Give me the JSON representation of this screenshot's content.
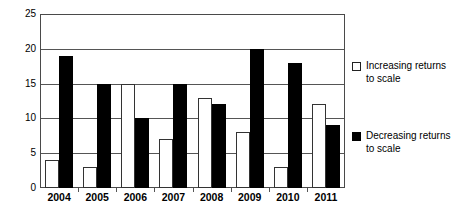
{
  "chart_data": {
    "type": "bar",
    "title": "",
    "xlabel": "",
    "ylabel": "",
    "ylim": [
      0,
      25
    ],
    "yticks": [
      0,
      5,
      10,
      15,
      20,
      25
    ],
    "grid": true,
    "legend_position": "right",
    "categories": [
      "2004",
      "2005",
      "2006",
      "2007",
      "2008",
      "2009",
      "2010",
      "2011"
    ],
    "series": [
      {
        "name": "Increasing returns to scale",
        "color": "#ffffff",
        "values": [
          4,
          3,
          15,
          7,
          13,
          8,
          3,
          12
        ]
      },
      {
        "name": "Decreasing returns to scale",
        "color": "#000000",
        "values": [
          19,
          15,
          10,
          15,
          12,
          20,
          18,
          9
        ]
      }
    ]
  },
  "legend": {
    "increasing": {
      "line1": "Increasing returns",
      "line2": "to scale",
      "swatch": "hollow-square"
    },
    "decreasing": {
      "line1": "Decreasing returns",
      "line2": "to scale",
      "swatch": "filled-square"
    }
  }
}
